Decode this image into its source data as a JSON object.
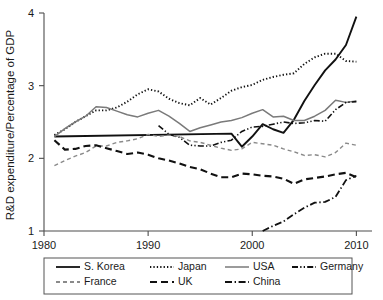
{
  "chart_data": {
    "type": "line",
    "title": "",
    "xlabel": "",
    "ylabel": "R&D expenditure/Percentage of GDP",
    "xlim": [
      1980,
      2011.5
    ],
    "ylim": [
      1,
      4
    ],
    "xticks": [
      1980,
      1990,
      2000,
      2010
    ],
    "xtick_labels": [
      "1980",
      "1990",
      "2000",
      "2010"
    ],
    "yticks": [
      1,
      2,
      3,
      4
    ],
    "ytick_labels": [
      "1",
      "2",
      "3",
      "4"
    ],
    "grid": false,
    "legend_position": "below-axes",
    "series": [
      {
        "name": "S. Korea",
        "style": "solid",
        "color": "#111111",
        "width": 1.9,
        "x": [
          1981,
          1998,
          1999,
          2000,
          2001,
          2002,
          2003,
          2004,
          2005,
          2006,
          2007,
          2008,
          2009,
          2010
        ],
        "values": [
          2.3,
          2.34,
          2.16,
          2.3,
          2.47,
          2.4,
          2.35,
          2.53,
          2.79,
          3.01,
          3.21,
          3.36,
          3.56,
          3.95
        ]
      },
      {
        "name": "Japan",
        "style": "dotted",
        "color": "#111111",
        "width": 1.9,
        "x": [
          1981,
          1982,
          1983,
          1984,
          1985,
          1986,
          1987,
          1988,
          1989,
          1990,
          1991,
          1992,
          1993,
          1994,
          1995,
          1996,
          1997,
          1998,
          1999,
          2000,
          2001,
          2002,
          2003,
          2004,
          2005,
          2006,
          2007,
          2008,
          2009,
          2010
        ],
        "values": [
          2.32,
          2.4,
          2.5,
          2.58,
          2.66,
          2.66,
          2.7,
          2.78,
          2.88,
          2.95,
          2.92,
          2.82,
          2.76,
          2.73,
          2.83,
          2.74,
          2.83,
          2.93,
          2.98,
          3.01,
          3.08,
          3.12,
          3.15,
          3.17,
          3.3,
          3.39,
          3.44,
          3.44,
          3.34,
          3.33
        ]
      },
      {
        "name": "USA",
        "style": "solid",
        "color": "#7a7a7a",
        "width": 1.5,
        "x": [
          1981,
          1982,
          1983,
          1984,
          1985,
          1986,
          1987,
          1988,
          1989,
          1990,
          1991,
          1992,
          1993,
          1994,
          1995,
          1996,
          1997,
          1998,
          1999,
          2000,
          2001,
          2002,
          2003,
          2004,
          2005,
          2006,
          2007,
          2008,
          2009,
          2010
        ],
        "values": [
          2.3,
          2.41,
          2.5,
          2.58,
          2.71,
          2.7,
          2.65,
          2.6,
          2.57,
          2.62,
          2.66,
          2.58,
          2.48,
          2.37,
          2.42,
          2.46,
          2.5,
          2.52,
          2.56,
          2.62,
          2.67,
          2.57,
          2.58,
          2.52,
          2.52,
          2.58,
          2.66,
          2.8,
          2.77,
          2.79
        ]
      },
      {
        "name": "Germany",
        "style": "dash-dot-dot",
        "color": "#111111",
        "width": 1.6,
        "x": [
          1991,
          1992,
          1993,
          1994,
          1995,
          1996,
          1997,
          1998,
          1999,
          2000,
          2001,
          2002,
          2003,
          2004,
          2005,
          2006,
          2007,
          2008,
          2009,
          2010
        ],
        "values": [
          2.45,
          2.33,
          2.29,
          2.18,
          2.17,
          2.17,
          2.22,
          2.25,
          2.37,
          2.43,
          2.44,
          2.47,
          2.5,
          2.48,
          2.49,
          2.52,
          2.51,
          2.67,
          2.77,
          2.78
        ]
      },
      {
        "name": "France",
        "style": "dashed",
        "color": "#8a8a8a",
        "width": 1.4,
        "x": [
          1981,
          1982,
          1983,
          1984,
          1985,
          1986,
          1987,
          1988,
          1989,
          1990,
          1991,
          1992,
          1993,
          1994,
          1995,
          1996,
          1997,
          1998,
          1999,
          2000,
          2001,
          2002,
          2003,
          2004,
          2005,
          2006,
          2007,
          2008,
          2009,
          2010
        ],
        "values": [
          1.9,
          1.97,
          2.03,
          2.08,
          2.17,
          2.17,
          2.22,
          2.24,
          2.27,
          2.33,
          2.3,
          2.32,
          2.3,
          2.24,
          2.22,
          2.18,
          2.14,
          2.11,
          2.13,
          2.22,
          2.2,
          2.18,
          2.13,
          2.09,
          2.04,
          2.05,
          2.02,
          2.08,
          2.21,
          2.18
        ]
      },
      {
        "name": "UK",
        "style": "long-dash",
        "color": "#111111",
        "width": 2.1,
        "x": [
          1981,
          1982,
          1983,
          1984,
          1985,
          1986,
          1987,
          1988,
          1989,
          1990,
          1991,
          1992,
          1993,
          1994,
          1995,
          1996,
          1997,
          1998,
          1999,
          2000,
          2001,
          2002,
          2003,
          2004,
          2005,
          2006,
          2007,
          2008,
          2009,
          2010
        ],
        "values": [
          2.25,
          2.12,
          2.13,
          2.17,
          2.18,
          2.14,
          2.1,
          2.06,
          2.08,
          2.05,
          2.0,
          1.97,
          1.93,
          1.88,
          1.85,
          1.79,
          1.74,
          1.74,
          1.79,
          1.78,
          1.76,
          1.75,
          1.72,
          1.65,
          1.71,
          1.73,
          1.75,
          1.78,
          1.8,
          1.74
        ]
      },
      {
        "name": "China",
        "style": "dash-dot",
        "color": "#111111",
        "width": 1.8,
        "x": [
          2001,
          2002,
          2003,
          2004,
          2005,
          2006,
          2007,
          2008,
          2009,
          2010
        ],
        "values": [
          1.0,
          1.07,
          1.13,
          1.23,
          1.32,
          1.39,
          1.4,
          1.47,
          1.7,
          1.76
        ]
      }
    ]
  },
  "legend": {
    "entries": [
      {
        "label": "S. Korea",
        "style": "solid",
        "color": "#111111"
      },
      {
        "label": "Japan",
        "style": "dotted",
        "color": "#111111"
      },
      {
        "label": "USA",
        "style": "solid",
        "color": "#7a7a7a"
      },
      {
        "label": "Germany",
        "style": "dash-dot-dot",
        "color": "#111111"
      },
      {
        "label": "France",
        "style": "dashed",
        "color": "#8a8a8a"
      },
      {
        "label": "UK",
        "style": "long-dash",
        "color": "#111111"
      },
      {
        "label": "China",
        "style": "dash-dot",
        "color": "#111111"
      }
    ]
  },
  "colors": {
    "axis": "#4d4d4d",
    "text": "#1a1a1a",
    "background": "#ffffff",
    "legend_border": "#555555"
  }
}
